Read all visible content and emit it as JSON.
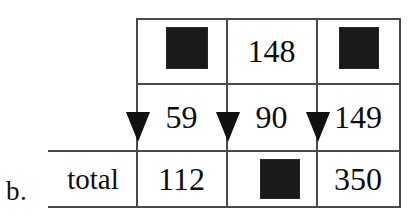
{
  "figure": {
    "part_label": "b.",
    "type": "two-way frequency table with column total arrows",
    "colors": {
      "rule": "#4a4a4a",
      "text": "#0d0d0d",
      "redaction": "#1a1a1a",
      "background": "#ffffff"
    }
  },
  "table": {
    "row_label": "total",
    "rows": [
      {
        "name": "row-1",
        "cells": [
          {
            "value": "",
            "redacted": true
          },
          {
            "value": "148",
            "redacted": false
          },
          {
            "value": "",
            "redacted": true
          }
        ]
      },
      {
        "name": "row-2",
        "cells": [
          {
            "value": "59",
            "redacted": false
          },
          {
            "value": "90",
            "redacted": false
          },
          {
            "value": "149",
            "redacted": false
          }
        ]
      },
      {
        "name": "total-row",
        "cells": [
          {
            "value": "112",
            "redacted": false
          },
          {
            "value": "",
            "redacted": true
          },
          {
            "value": "350",
            "redacted": false
          }
        ]
      }
    ]
  },
  "arrows": [
    {
      "name": "column-1-total-arrow",
      "direction": "down"
    },
    {
      "name": "column-2-total-arrow",
      "direction": "down"
    },
    {
      "name": "column-3-total-arrow",
      "direction": "down"
    }
  ]
}
